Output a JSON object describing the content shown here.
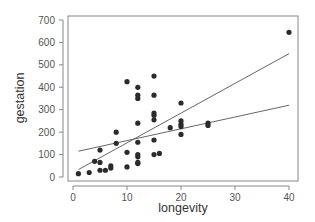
{
  "chart_data": {
    "type": "scatter",
    "title": "",
    "xlabel": "longevity",
    "ylabel": "gestation",
    "xlim": [
      0,
      40
    ],
    "ylim": [
      0,
      700
    ],
    "xticks": [
      0,
      10,
      20,
      30,
      40
    ],
    "yticks": [
      0,
      100,
      200,
      300,
      400,
      500,
      600,
      700
    ],
    "grid": false,
    "legend": null,
    "points": [
      [
        1,
        15
      ],
      [
        3,
        20
      ],
      [
        4,
        70
      ],
      [
        5,
        30
      ],
      [
        5,
        65
      ],
      [
        5,
        120
      ],
      [
        6,
        30
      ],
      [
        7,
        40
      ],
      [
        7,
        50
      ],
      [
        8,
        150
      ],
      [
        8,
        200
      ],
      [
        10,
        45
      ],
      [
        10,
        110
      ],
      [
        10,
        425
      ],
      [
        12,
        60
      ],
      [
        12,
        65
      ],
      [
        12,
        90
      ],
      [
        12,
        100
      ],
      [
        12,
        155
      ],
      [
        12,
        240
      ],
      [
        12,
        350
      ],
      [
        12,
        365
      ],
      [
        12,
        400
      ],
      [
        15,
        100
      ],
      [
        15,
        165
      ],
      [
        15,
        255
      ],
      [
        15,
        275
      ],
      [
        15,
        285
      ],
      [
        15,
        365
      ],
      [
        15,
        450
      ],
      [
        16,
        105
      ],
      [
        18,
        220
      ],
      [
        20,
        190
      ],
      [
        20,
        225
      ],
      [
        20,
        235
      ],
      [
        20,
        250
      ],
      [
        20,
        330
      ],
      [
        25,
        230
      ],
      [
        25,
        240
      ],
      [
        40,
        645
      ]
    ],
    "lines": [
      {
        "name": "fit-steep",
        "x": [
          1,
          40
        ],
        "y": [
          33,
          550
        ]
      },
      {
        "name": "fit-flat",
        "x": [
          1,
          40
        ],
        "y": [
          115,
          320
        ]
      }
    ]
  },
  "colors": {
    "point": "#2b2b2b",
    "line": "#555555",
    "frame": "#888888",
    "axis": "#888888"
  }
}
